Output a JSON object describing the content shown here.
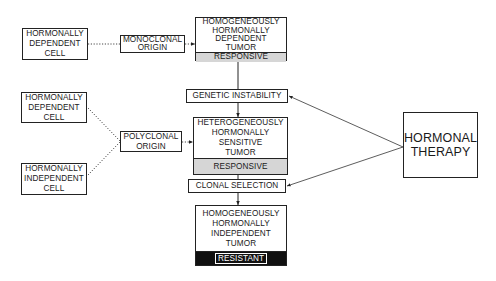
{
  "diagram": {
    "cells": {
      "mono_source": {
        "lines": [
          "HORMONALLY",
          "DEPENDENT",
          "CELL"
        ]
      },
      "poly_source_dependent": {
        "lines": [
          "HORMONALLY",
          "DEPENDENT",
          "CELL"
        ]
      },
      "poly_source_independent": {
        "lines": [
          "HORMONALLY",
          "INDEPENDENT",
          "CELL"
        ]
      }
    },
    "origins": {
      "monoclonal": {
        "lines": [
          "MONOCLONAL",
          "ORIGIN"
        ]
      },
      "polyclonal": {
        "lines": [
          "POLYCLONAL",
          "ORIGIN"
        ]
      }
    },
    "tumors": {
      "homogeneous_dependent": {
        "lines": [
          "HOMOGENEOUSLY",
          "HORMONALLY",
          "DEPENDENT",
          "TUMOR"
        ],
        "status": "RESPONSIVE"
      },
      "heterogeneous_sensitive": {
        "lines": [
          "HETEROGENEOUSLY",
          "HORMONALLY",
          "SENSITIVE",
          "TUMOR"
        ],
        "status": "RESPONSIVE"
      },
      "homogeneous_independent": {
        "lines": [
          "HOMOGENEOUSLY",
          "HORMONALLY",
          "INDEPENDENT",
          "TUMOR"
        ],
        "status": "RESISTANT"
      }
    },
    "processes": {
      "genetic_instability": "GENETIC INSTABILITY",
      "clonal_selection": "CLONAL SELECTION"
    },
    "therapy": {
      "lines": [
        "HORMONAL",
        "THERAPY"
      ]
    },
    "colors": {
      "line": "#222222",
      "responsive_fill": "#d6d6d6",
      "resistant_fill": "#111111"
    }
  }
}
